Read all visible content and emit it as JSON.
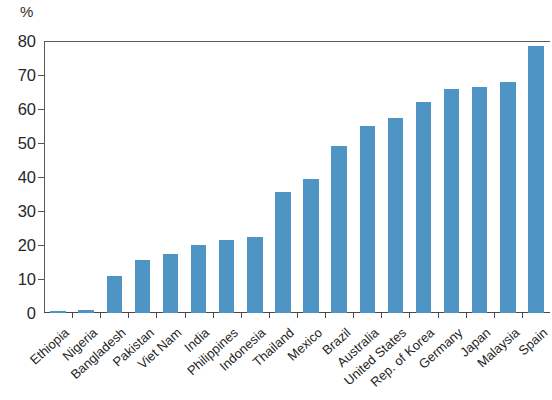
{
  "chart_data": {
    "type": "bar",
    "title": "",
    "subtitle": "",
    "unit_label": "%",
    "xlabel": "",
    "ylabel": "",
    "ylim": [
      0,
      80
    ],
    "ytick_values": [
      0,
      10,
      20,
      30,
      40,
      50,
      60,
      70,
      80
    ],
    "ytick_labels": [
      "0",
      "10",
      "20",
      "30",
      "40",
      "50",
      "60",
      "70",
      "80"
    ],
    "grid": false,
    "legend": null,
    "bar_color": "#4e95c6",
    "axis_color": "#4a4a4a",
    "categories": [
      "Ethiopia",
      "Nigeria",
      "Bangladesh",
      "Pakistan",
      "Viet Nam",
      "India",
      "Philippines",
      "Indonesia",
      "Thailand",
      "Mexico",
      "Brazil",
      "Australia",
      "United States",
      "Rep. of Korea",
      "Germany",
      "Japan",
      "Malaysia",
      "Spain"
    ],
    "values": [
      0.6,
      0.9,
      11,
      15.5,
      17.5,
      20,
      21.5,
      22.5,
      35.5,
      39.5,
      49,
      55,
      57.5,
      62,
      66,
      66.5,
      68,
      78.5
    ]
  }
}
